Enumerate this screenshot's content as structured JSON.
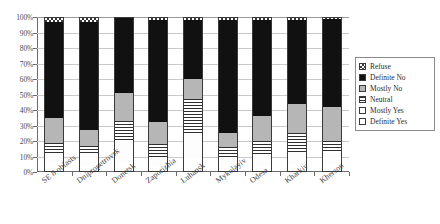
{
  "chart_data": {
    "type": "bar",
    "subtype": "100% stacked column",
    "title": "",
    "xlabel": "",
    "ylabel": "",
    "ylim": [
      0,
      100
    ],
    "ytick_labels": [
      "100%",
      "90%",
      "80%",
      "70%",
      "60%",
      "50%",
      "40%",
      "30%",
      "20%",
      "10%",
      "0%"
    ],
    "ytick_values": [
      100,
      90,
      80,
      70,
      60,
      50,
      40,
      30,
      20,
      10,
      0
    ],
    "grid": true,
    "legend_position": "right",
    "categories": [
      "SE 8 oblasts",
      "Dnipropetrovsk",
      "Donetsk",
      "Zaporizhia",
      "Luhansk",
      "Mykolayiv",
      "Odesa",
      "Kharkiv",
      "Kherson"
    ],
    "series": [
      {
        "name": "Definite Yes",
        "pattern": "open-white",
        "values": [
          6,
          4,
          6,
          4,
          9,
          3,
          4,
          5,
          5
        ]
      },
      {
        "name": "Mostly Yes",
        "pattern": "white",
        "values": [
          5,
          7,
          14,
          5,
          16,
          6,
          7,
          8,
          7
        ]
      },
      {
        "name": "Neutral",
        "pattern": "horizontal-lines",
        "values": [
          8,
          6,
          13,
          9,
          22,
          7,
          9,
          12,
          8
        ]
      },
      {
        "name": "Mostly No",
        "pattern": "light-gray",
        "values": [
          16,
          10,
          18,
          14,
          13,
          9,
          16,
          19,
          22
        ]
      },
      {
        "name": "Definite No",
        "pattern": "solid-black",
        "values": [
          62,
          70,
          49,
          66,
          38,
          73,
          62,
          54,
          57
        ]
      },
      {
        "name": "Refuse",
        "pattern": "checkered",
        "values": [
          3,
          3,
          0,
          2,
          2,
          2,
          2,
          2,
          1
        ]
      }
    ]
  },
  "legend": {
    "items": [
      {
        "label": "Refuse",
        "pattern": "checkered"
      },
      {
        "label": "Definite No",
        "pattern": "solid-black"
      },
      {
        "label": "Mostly No",
        "pattern": "light-gray"
      },
      {
        "label": "Neutral",
        "pattern": "horizontal-lines"
      },
      {
        "label": "Mostly Yes",
        "pattern": "white"
      },
      {
        "label": "Definite Yes",
        "pattern": "open-white"
      }
    ]
  },
  "colors": {
    "definite_no": "#111111",
    "mostly_no": "#b6b6b6",
    "neutral": "#2f2f2f",
    "axis": "#6b6b6b",
    "grid": "#c9c9c9"
  }
}
